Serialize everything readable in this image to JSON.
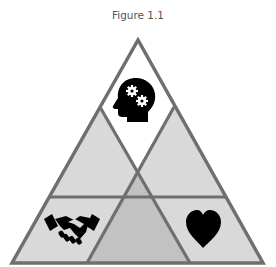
{
  "figure": {
    "caption": "Figure 1.1",
    "colors": {
      "stroke": "#6f6f6f",
      "top_fill": "#ffffff",
      "side_fill": "#d9d9d9",
      "center_fill": "#c2c2c2",
      "icon": "#000000"
    },
    "sections": [
      {
        "position": "top",
        "icon": "head-gears-icon"
      },
      {
        "position": "bottom-left",
        "icon": "handshake-icon"
      },
      {
        "position": "bottom-right",
        "icon": "heart-icon"
      },
      {
        "position": "bottom-center",
        "icon": ""
      }
    ]
  }
}
